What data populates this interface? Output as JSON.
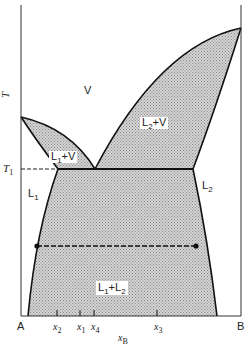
{
  "diagram": {
    "type": "phase-diagram",
    "axes": {
      "y_label": "T",
      "x_label": "x",
      "x_label_sub": "B",
      "left_end": "A",
      "right_end": "B",
      "t1_label": "T",
      "t1_sub": "1"
    },
    "regions": {
      "vapor": "V",
      "l1_v": {
        "main": "L",
        "sub": "1",
        "rest": "+V"
      },
      "l2_v": {
        "main": "L",
        "sub": "2",
        "rest": "+V"
      },
      "l1": {
        "main": "L",
        "sub": "1"
      },
      "l2": {
        "main": "L",
        "sub": "2"
      },
      "l1_l2": {
        "main": "L",
        "sub": "1",
        "plus": "+L",
        "sub2": "2"
      }
    },
    "ticks": [
      {
        "name": "x",
        "sub": "2"
      },
      {
        "name": "x",
        "sub": "1"
      },
      {
        "name": "x",
        "sub": "4"
      },
      {
        "name": "x",
        "sub": "3"
      }
    ],
    "colors": {
      "line": "#111111",
      "fill": "#b9b9b9",
      "background": "#ffffff"
    }
  }
}
